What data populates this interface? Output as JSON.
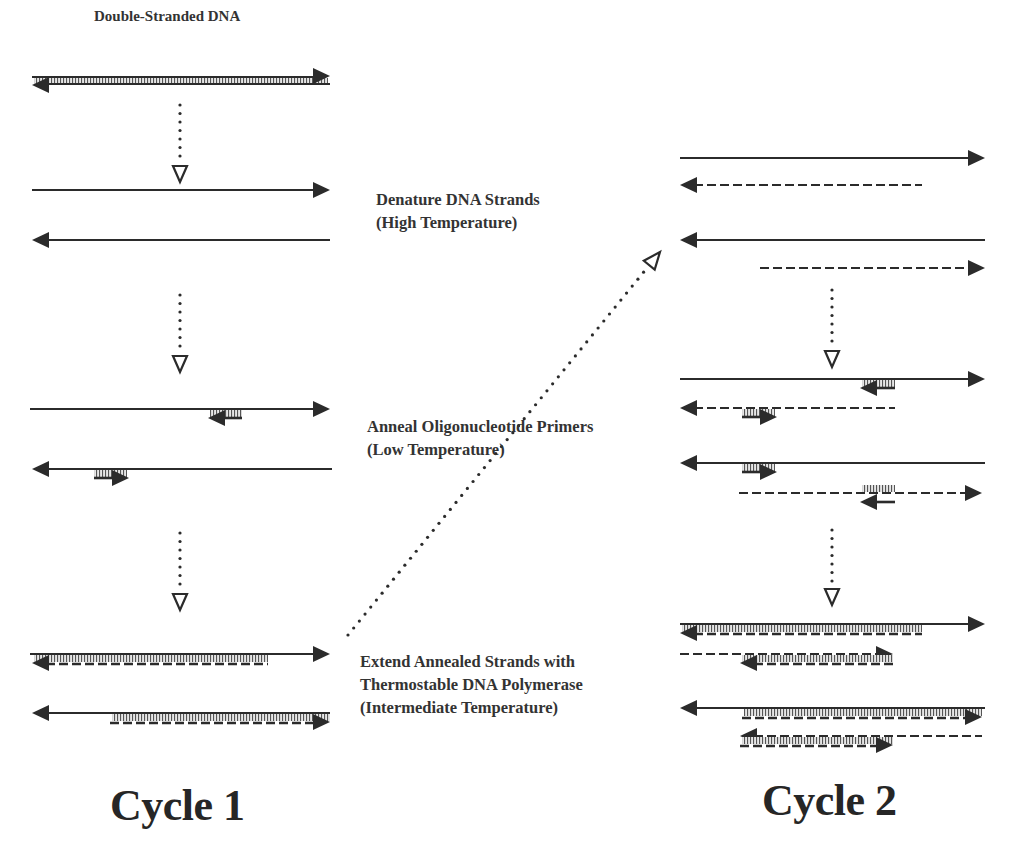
{
  "diagram": {
    "title": "Double-Stranded DNA",
    "steps": [
      {
        "name": "denature",
        "lines": [
          "Denature DNA Strands",
          "(High Temperature)"
        ]
      },
      {
        "name": "anneal",
        "lines": [
          "Anneal Oligonucleotide Primers",
          "(Low Temperature)"
        ]
      },
      {
        "name": "extend",
        "lines": [
          "Extend Annealed Strands with",
          "Thermostable DNA Polymerase",
          "(Intermediate Temperature)"
        ]
      }
    ],
    "cycles": [
      {
        "label": "Cycle 1"
      },
      {
        "label": "Cycle 2"
      }
    ],
    "colors": {
      "ink": "#2b2b2b",
      "text": "#333333",
      "background": "#ffffff"
    },
    "icons": {
      "arrowhead": "filled-triangle",
      "flow_arrow": "hollow-triangle",
      "primer": "hatched-block-with-arrow",
      "new_strand": "dashed-line"
    },
    "elements": {
      "cycle1": [
        {
          "type": "ds",
          "y": 80,
          "x1": 32,
          "x2": 330
        },
        {
          "type": "flow",
          "x": 180,
          "y1": 105,
          "y2": 182
        },
        {
          "type": "strand",
          "dir": "right",
          "style": "solid",
          "y": 190,
          "x1": 32,
          "x2": 330
        },
        {
          "type": "strand",
          "dir": "left",
          "style": "solid",
          "y": 240,
          "x1": 32,
          "x2": 330
        },
        {
          "type": "flow",
          "x": 180,
          "y1": 295,
          "y2": 372
        },
        {
          "type": "strand",
          "dir": "right",
          "style": "solid",
          "y": 409,
          "x1": 30,
          "x2": 330
        },
        {
          "type": "primer",
          "dir": "left",
          "y": 409,
          "x1": 210,
          "x2": 242,
          "side": "below"
        },
        {
          "type": "strand",
          "dir": "left",
          "style": "solid",
          "y": 469,
          "x1": 32,
          "x2": 332
        },
        {
          "type": "primer",
          "dir": "right",
          "y": 469,
          "x1": 94,
          "x2": 127,
          "side": "below"
        },
        {
          "type": "flow",
          "x": 180,
          "y1": 533,
          "y2": 610
        },
        {
          "type": "strand",
          "dir": "right",
          "style": "solid",
          "y": 654,
          "x1": 30,
          "x2": 330
        },
        {
          "type": "extended",
          "dir": "left",
          "y": 654,
          "x1": 32,
          "x2": 268,
          "side": "below"
        },
        {
          "type": "strand",
          "dir": "left",
          "style": "solid",
          "y": 713,
          "x1": 32,
          "x2": 330
        },
        {
          "type": "extended",
          "dir": "right",
          "y": 713,
          "x1": 110,
          "x2": 330,
          "side": "below"
        }
      ],
      "diagonal_flow": {
        "x1": 348,
        "y1": 635,
        "x2": 660,
        "y2": 252
      },
      "cycle2": [
        {
          "type": "strand",
          "dir": "right",
          "style": "solid",
          "y": 158,
          "x1": 680,
          "x2": 985
        },
        {
          "type": "strand",
          "dir": "left",
          "style": "dashed",
          "y": 185,
          "x1": 680,
          "x2": 922
        },
        {
          "type": "strand",
          "dir": "left",
          "style": "solid",
          "y": 240,
          "x1": 680,
          "x2": 985
        },
        {
          "type": "strand",
          "dir": "right",
          "style": "dashed",
          "y": 268,
          "x1": 760,
          "x2": 985
        },
        {
          "type": "flow",
          "x": 832,
          "y1": 290,
          "y2": 367
        },
        {
          "type": "strand",
          "dir": "right",
          "style": "solid",
          "y": 379,
          "x1": 680,
          "x2": 985
        },
        {
          "type": "primer",
          "dir": "left",
          "y": 379,
          "x1": 862,
          "x2": 895,
          "side": "below"
        },
        {
          "type": "strand",
          "dir": "left",
          "style": "dashed",
          "y": 408,
          "x1": 680,
          "x2": 895
        },
        {
          "type": "primer",
          "dir": "right",
          "y": 408,
          "x1": 742,
          "x2": 775,
          "side": "below"
        },
        {
          "type": "strand",
          "dir": "left",
          "style": "solid",
          "y": 463,
          "x1": 680,
          "x2": 985
        },
        {
          "type": "primer",
          "dir": "right",
          "y": 463,
          "x1": 742,
          "x2": 775,
          "side": "below"
        },
        {
          "type": "strand",
          "dir": "right",
          "style": "dashed",
          "y": 493,
          "x1": 739,
          "x2": 982
        },
        {
          "type": "primer",
          "dir": "left",
          "y": 493,
          "x1": 862,
          "x2": 895,
          "side": "above"
        },
        {
          "type": "flow",
          "x": 832,
          "y1": 530,
          "y2": 605
        },
        {
          "type": "strand",
          "dir": "right",
          "style": "solid",
          "y": 624,
          "x1": 680,
          "x2": 985
        },
        {
          "type": "extended",
          "dir": "left",
          "y": 624,
          "x1": 680,
          "x2": 922,
          "side": "below"
        },
        {
          "type": "strand",
          "dir": "right",
          "style": "dashed",
          "y": 654,
          "x1": 680,
          "x2": 893
        },
        {
          "type": "extended",
          "dir": "left",
          "y": 654,
          "x1": 740,
          "x2": 893,
          "side": "below"
        },
        {
          "type": "strand",
          "dir": "left",
          "style": "solid",
          "y": 708,
          "x1": 680,
          "x2": 985
        },
        {
          "type": "extended",
          "dir": "right",
          "y": 708,
          "x1": 742,
          "x2": 982,
          "side": "below"
        },
        {
          "type": "strand",
          "dir": "left",
          "style": "dashed",
          "y": 736,
          "x1": 740,
          "x2": 982
        },
        {
          "type": "extended",
          "dir": "right",
          "y": 736,
          "x1": 740,
          "x2": 893,
          "side": "below"
        }
      ]
    }
  }
}
